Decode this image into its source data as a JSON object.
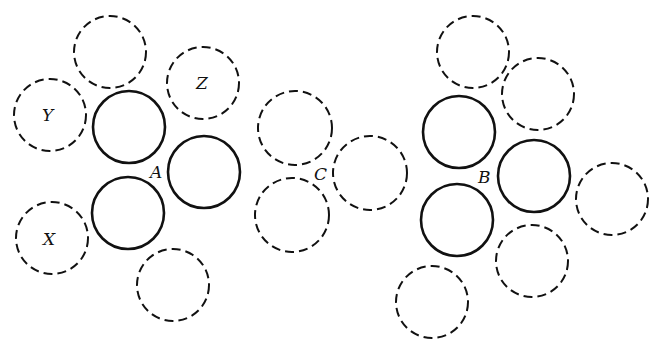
{
  "diagram": {
    "labels": {
      "A": "A",
      "C": "C",
      "B": "B",
      "X": "X",
      "Y": "Y",
      "Z": "Z"
    },
    "groups": [
      {
        "name": "A",
        "label_pos": [
          158,
          177
        ],
        "circles": [
          {
            "id": "a-top-dashed",
            "cx": 110,
            "cy": 52,
            "r": 36,
            "style": "dashed"
          },
          {
            "id": "a-z-dashed",
            "cx": 203,
            "cy": 83,
            "r": 36,
            "style": "dashed",
            "label": "Z"
          },
          {
            "id": "a-y-dashed",
            "cx": 50,
            "cy": 115,
            "r": 36,
            "style": "dashed",
            "label": "Y"
          },
          {
            "id": "a-upper-solid",
            "cx": 129,
            "cy": 127,
            "r": 36,
            "style": "solid"
          },
          {
            "id": "a-right-solid",
            "cx": 204,
            "cy": 172,
            "r": 36,
            "style": "solid"
          },
          {
            "id": "a-lower-solid",
            "cx": 128,
            "cy": 213,
            "r": 36,
            "style": "solid"
          },
          {
            "id": "a-x-dashed",
            "cx": 52,
            "cy": 238,
            "r": 36,
            "style": "dashed",
            "label": "X"
          },
          {
            "id": "a-bottom-dashed",
            "cx": 173,
            "cy": 285,
            "r": 36,
            "style": "dashed"
          }
        ]
      },
      {
        "name": "C",
        "label_pos": [
          322,
          179
        ],
        "circles": [
          {
            "id": "c-top-dashed",
            "cx": 295,
            "cy": 128,
            "r": 37,
            "style": "dashed"
          },
          {
            "id": "c-right-dashed",
            "cx": 370,
            "cy": 173,
            "r": 37,
            "style": "dashed"
          },
          {
            "id": "c-bottom-dashed",
            "cx": 292,
            "cy": 215,
            "r": 37,
            "style": "dashed"
          }
        ]
      },
      {
        "name": "B",
        "label_pos": [
          486,
          182
        ],
        "circles": [
          {
            "id": "b-top-dashed",
            "cx": 473,
            "cy": 52,
            "r": 36,
            "style": "dashed"
          },
          {
            "id": "b-upper-right-dashed",
            "cx": 538,
            "cy": 94,
            "r": 36,
            "style": "dashed"
          },
          {
            "id": "b-upper-solid",
            "cx": 459,
            "cy": 132,
            "r": 36,
            "style": "solid"
          },
          {
            "id": "b-right-solid",
            "cx": 534,
            "cy": 176,
            "r": 36,
            "style": "solid"
          },
          {
            "id": "b-far-right-dashed",
            "cx": 612,
            "cy": 199,
            "r": 36,
            "style": "dashed"
          },
          {
            "id": "b-lower-solid",
            "cx": 457,
            "cy": 220,
            "r": 36,
            "style": "solid"
          },
          {
            "id": "b-lower-dashed",
            "cx": 532,
            "cy": 261,
            "r": 36,
            "style": "dashed"
          },
          {
            "id": "b-bottom-left-dashed",
            "cx": 432,
            "cy": 302,
            "r": 36,
            "style": "dashed"
          }
        ]
      }
    ]
  }
}
